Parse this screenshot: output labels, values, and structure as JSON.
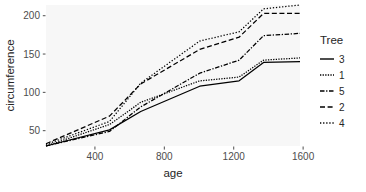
{
  "chart_data": {
    "type": "line",
    "title": "",
    "xlabel": "age",
    "ylabel": "circumference",
    "xlim": [
      118,
      1582
    ],
    "ylim": [
      30,
      214
    ],
    "xticks": [
      400,
      800,
      1200,
      1600
    ],
    "yticks": [
      50,
      100,
      150,
      200
    ],
    "grid": false,
    "legend": {
      "title": "Tree",
      "position": "right",
      "entries": [
        {
          "name": "3",
          "linetype": "solid"
        },
        {
          "name": "1",
          "linetype": "dotted-fine"
        },
        {
          "name": "5",
          "linetype": "dash-dot"
        },
        {
          "name": "2",
          "linetype": "dashed"
        },
        {
          "name": "4",
          "linetype": "dotted"
        }
      ]
    },
    "x": [
      118,
      484,
      664,
      1004,
      1231,
      1372,
      1582
    ],
    "series": [
      {
        "name": "3",
        "linetype": "solid",
        "values": [
          30,
          51,
          75,
          108,
          115,
          139,
          140
        ]
      },
      {
        "name": "1",
        "linetype": "dotted-fine",
        "values": [
          30,
          58,
          87,
          115,
          120,
          142,
          145
        ]
      },
      {
        "name": "5",
        "linetype": "dash-dot",
        "values": [
          30,
          49,
          81,
          125,
          142,
          174,
          177
        ]
      },
      {
        "name": "2",
        "linetype": "dashed",
        "values": [
          33,
          69,
          111,
          156,
          172,
          203,
          203
        ]
      },
      {
        "name": "4",
        "linetype": "dotted",
        "values": [
          32,
          62,
          112,
          167,
          179,
          209,
          214
        ]
      }
    ],
    "colors": {
      "panel_background": "#f7f7f7",
      "line": "#000000",
      "axis_text": "#4d4d4d",
      "axis_title": "#262626",
      "page_background": "#ffffff"
    }
  }
}
